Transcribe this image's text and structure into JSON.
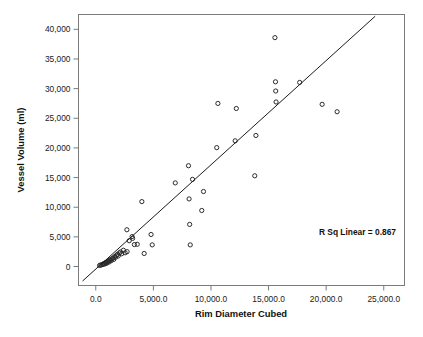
{
  "chart_data": {
    "type": "scatter",
    "title": "",
    "xlabel": "Rim Diameter Cubed",
    "ylabel": "Vessel Volume (ml)",
    "xlim": [
      -1500,
      26800
    ],
    "ylim": [
      -3200,
      42500
    ],
    "xticks": [
      0,
      5000,
      10000,
      15000,
      20000,
      25000
    ],
    "yticks": [
      0,
      5000,
      10000,
      15000,
      20000,
      25000,
      30000,
      35000,
      40000
    ],
    "xtick_labels": [
      "0.0",
      "5,000.0",
      "10,000.0",
      "15,000.0",
      "20,000.0",
      "25,000.0"
    ],
    "ytick_labels": [
      "0",
      "5,000",
      "10,000",
      "15,000",
      "20,000",
      "25,000",
      "30,000",
      "35,000",
      "40,000"
    ],
    "grid": false,
    "legend": "none",
    "annotation": "R Sq Linear = 0.867",
    "r_squared": 0.867,
    "marker": "open-circle",
    "marker_color": "#2b2b2b",
    "fit_line": {
      "type": "linear",
      "x_start": -1150,
      "y_start": -2450,
      "x_end": 24250,
      "y_end": 42200
    },
    "points": [
      {
        "x": 330,
        "y": 180
      },
      {
        "x": 430,
        "y": 250
      },
      {
        "x": 520,
        "y": 300
      },
      {
        "x": 600,
        "y": 360
      },
      {
        "x": 660,
        "y": 420
      },
      {
        "x": 720,
        "y": 500
      },
      {
        "x": 790,
        "y": 430
      },
      {
        "x": 850,
        "y": 620
      },
      {
        "x": 900,
        "y": 700
      },
      {
        "x": 960,
        "y": 560
      },
      {
        "x": 1020,
        "y": 820
      },
      {
        "x": 1090,
        "y": 900
      },
      {
        "x": 1150,
        "y": 760
      },
      {
        "x": 1210,
        "y": 1050
      },
      {
        "x": 1280,
        "y": 1150
      },
      {
        "x": 1340,
        "y": 980
      },
      {
        "x": 1420,
        "y": 1320
      },
      {
        "x": 1500,
        "y": 1450
      },
      {
        "x": 1560,
        "y": 1200
      },
      {
        "x": 1650,
        "y": 1680
      },
      {
        "x": 1720,
        "y": 1560
      },
      {
        "x": 1800,
        "y": 1900
      },
      {
        "x": 1880,
        "y": 2050
      },
      {
        "x": 1950,
        "y": 1780
      },
      {
        "x": 2050,
        "y": 2300
      },
      {
        "x": 2150,
        "y": 2450
      },
      {
        "x": 2250,
        "y": 2150
      },
      {
        "x": 2400,
        "y": 2750
      },
      {
        "x": 2550,
        "y": 2320
      },
      {
        "x": 2700,
        "y": 6200
      },
      {
        "x": 2720,
        "y": 2500
      },
      {
        "x": 2900,
        "y": 4350
      },
      {
        "x": 3150,
        "y": 5050
      },
      {
        "x": 3200,
        "y": 4750
      },
      {
        "x": 3350,
        "y": 3700
      },
      {
        "x": 3600,
        "y": 3750
      },
      {
        "x": 4000,
        "y": 10950
      },
      {
        "x": 4200,
        "y": 2200
      },
      {
        "x": 4800,
        "y": 5400
      },
      {
        "x": 4900,
        "y": 3650
      },
      {
        "x": 6900,
        "y": 14100
      },
      {
        "x": 8050,
        "y": 17000
      },
      {
        "x": 8100,
        "y": 11400
      },
      {
        "x": 8150,
        "y": 7100
      },
      {
        "x": 8200,
        "y": 3650
      },
      {
        "x": 8400,
        "y": 14700
      },
      {
        "x": 9200,
        "y": 9450
      },
      {
        "x": 9350,
        "y": 12650
      },
      {
        "x": 10500,
        "y": 20050
      },
      {
        "x": 10600,
        "y": 27500
      },
      {
        "x": 12100,
        "y": 21200
      },
      {
        "x": 12200,
        "y": 26650
      },
      {
        "x": 13800,
        "y": 15300
      },
      {
        "x": 13900,
        "y": 22100
      },
      {
        "x": 15550,
        "y": 38600
      },
      {
        "x": 15600,
        "y": 31150
      },
      {
        "x": 15620,
        "y": 29600
      },
      {
        "x": 15650,
        "y": 27750
      },
      {
        "x": 17700,
        "y": 31050
      },
      {
        "x": 19650,
        "y": 27350
      },
      {
        "x": 20950,
        "y": 26100
      }
    ]
  }
}
